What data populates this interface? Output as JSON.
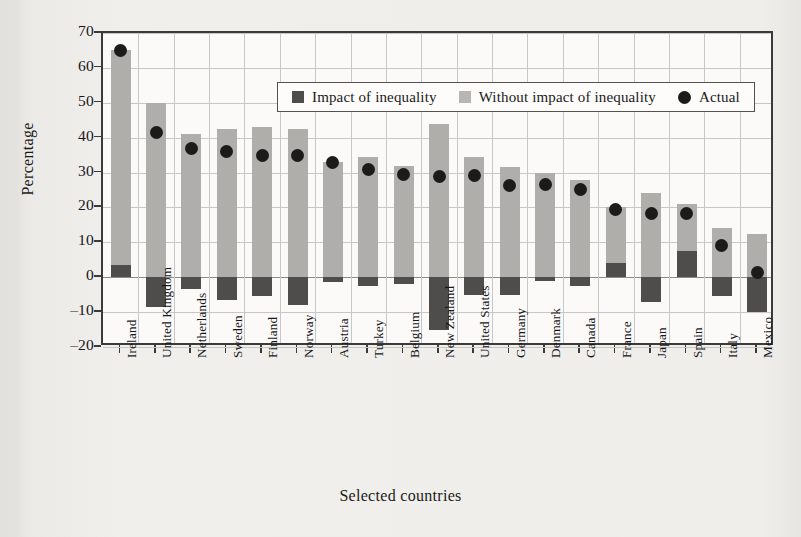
{
  "chart_data": {
    "type": "bar",
    "title": "",
    "xlabel": "Selected countries",
    "ylabel": "Percentage",
    "ylim": [
      -20,
      70
    ],
    "yticks": [
      70,
      60,
      50,
      40,
      30,
      20,
      10,
      0,
      -10,
      -20
    ],
    "ytick_labels": [
      "70",
      "60",
      "50",
      "40",
      "30",
      "20",
      "10",
      "0",
      "–10",
      "–20"
    ],
    "grid": true,
    "legend_position": "top-left-inside",
    "legend": [
      {
        "label": "Impact of inequality",
        "marker": "square",
        "color": "#4e4d4c"
      },
      {
        "label": "Without impact of inequality",
        "marker": "square",
        "color": "#b8b6b3"
      },
      {
        "label": "Actual",
        "marker": "circle",
        "color": "#1c1b1a"
      }
    ],
    "categories": [
      "Ireland",
      "United Kingdom",
      "Netherlands",
      "Sweden",
      "Finland",
      "Norway",
      "Austria",
      "Turkey",
      "Belgium",
      "New Zealand",
      "United States",
      "Germany",
      "Denmark",
      "Canada",
      "France",
      "Japan",
      "Spain",
      "Italy",
      "Mexico"
    ],
    "series": [
      {
        "name": "Without impact of inequality",
        "color": "#b0aeab",
        "values": [
          65.0,
          50.0,
          41.0,
          42.5,
          43.0,
          42.5,
          33.0,
          34.5,
          32.0,
          44.0,
          34.5,
          31.5,
          30.0,
          28.0,
          20.0,
          24.0,
          21.0,
          14.0,
          12.5
        ]
      },
      {
        "name": "Impact of inequality",
        "color": "#4e4d4c",
        "values": [
          3.5,
          -8.5,
          -3.5,
          -6.5,
          -5.5,
          -8.0,
          -1.5,
          -2.5,
          -2.0,
          -15.0,
          -5.0,
          -5.0,
          -1.0,
          -2.5,
          4.0,
          -7.0,
          7.5,
          -5.5,
          -10.0
        ]
      },
      {
        "name": "Actual",
        "color": "#1c1b1a",
        "type": "scatter",
        "values": [
          65.0,
          41.5,
          37.0,
          36.0,
          35.0,
          34.8,
          32.8,
          30.8,
          29.5,
          29.0,
          29.2,
          26.3,
          26.7,
          25.2,
          19.5,
          18.2,
          18.3,
          9.0,
          1.3
        ]
      }
    ]
  }
}
